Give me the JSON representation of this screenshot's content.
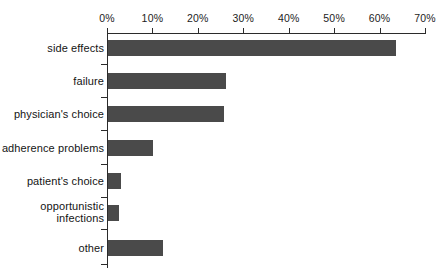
{
  "chart_data": {
    "type": "bar",
    "orientation": "horizontal",
    "title": "",
    "subtitle": "",
    "xlabel": "",
    "ylabel": "",
    "categories": [
      "side effects",
      "failure",
      "physician's choice",
      "adherence problems",
      "patient's choice",
      "opportunistic\ninfections",
      "other"
    ],
    "values": [
      63.5,
      26.0,
      25.5,
      10.0,
      2.9,
      2.4,
      12.0
    ],
    "value_unit": "%",
    "xlim": [
      0,
      70
    ],
    "xtick_labels": [
      "0%",
      "10%",
      "20%",
      "30%",
      "40%",
      "50%",
      "60%",
      "70%"
    ],
    "xtick_values": [
      0,
      10,
      20,
      30,
      40,
      50,
      60,
      70
    ],
    "grid": false,
    "legend": null,
    "series": [
      {
        "name": "reason for regimen change",
        "values": [
          63.5,
          26.0,
          25.5,
          10.0,
          2.9,
          2.4,
          12.0
        ]
      }
    ],
    "colors": {
      "bar": "#4a4a4a",
      "axis": "#2b2b2b",
      "text": "#141414",
      "background": "#ffffff"
    }
  },
  "geometry": {
    "axis_x0_px": 107,
    "axis_x70_px": 425,
    "px_per_percent": 4.5428,
    "row_tops_px": [
      40,
      73,
      106,
      140,
      173,
      205,
      240
    ],
    "bar_height_px": 16,
    "label_tops_px": [
      42,
      75,
      108,
      142,
      175,
      200,
      242
    ]
  }
}
